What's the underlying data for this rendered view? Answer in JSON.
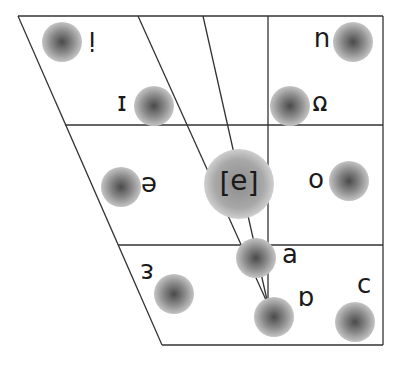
{
  "diagram": {
    "colors": {
      "line": "#333333",
      "dot_center": "#555555",
      "dot_edge": "#bdbdbd",
      "text": "#1a1a1a"
    },
    "vowels": [
      {
        "id": "i",
        "symbol": "i",
        "dot": [
          62,
          42
        ],
        "r": 20,
        "label": [
          92,
          41
        ]
      },
      {
        "id": "u",
        "symbol": "u",
        "dot": [
          353,
          42
        ],
        "r": 20,
        "label": [
          322,
          41
        ]
      },
      {
        "id": "small-cap-i",
        "symbol": "ɪ",
        "dot": [
          154,
          106
        ],
        "r": 20,
        "label": [
          122,
          105
        ]
      },
      {
        "id": "upsilon",
        "symbol": "ʊ",
        "dot": [
          290,
          106
        ],
        "r": 20,
        "label": [
          320,
          105
        ]
      },
      {
        "id": "e",
        "symbol": "e",
        "dot": [
          121,
          187
        ],
        "r": 20,
        "label": [
          149,
          186
        ]
      },
      {
        "id": "schwa",
        "symbol": "[ə]",
        "dot": [
          239,
          184
        ],
        "r": 35,
        "label": [
          239,
          183
        ]
      },
      {
        "id": "o",
        "symbol": "o",
        "dot": [
          349,
          181
        ],
        "r": 20,
        "label": [
          316,
          182
        ]
      },
      {
        "id": "turned-a",
        "symbol": "ɐ",
        "dot": [
          256,
          258
        ],
        "r": 20,
        "label": [
          290,
          257
        ]
      },
      {
        "id": "open-e",
        "symbol": "ɛ",
        "dot": [
          174,
          294
        ],
        "r": 20,
        "label": [
          147,
          273
        ]
      },
      {
        "id": "script-a",
        "symbol": "ɑ",
        "dot": [
          274,
          317
        ],
        "r": 20,
        "label": [
          306,
          300
        ]
      },
      {
        "id": "open-o",
        "symbol": "ɔ",
        "dot": [
          355,
          322
        ],
        "r": 20,
        "label": [
          364,
          287
        ]
      }
    ]
  }
}
